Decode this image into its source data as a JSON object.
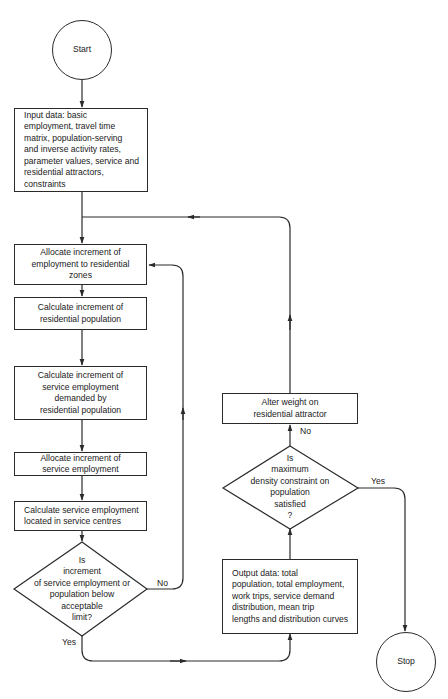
{
  "diagram": {
    "type": "flowchart",
    "nodes": {
      "start": {
        "label": "Start",
        "shape": "circle"
      },
      "input": {
        "label": "Input data: basic\nemployment, travel time\nmatrix, population-serving\nand inverse activity rates,\nparameter values, service and\nresidential attractors, constraints",
        "shape": "process"
      },
      "allocate_employment": {
        "label": "Allocate increment of\nemployment to residential\nzones",
        "shape": "process"
      },
      "calc_residential": {
        "label": "Calculate increment of\nresidential population",
        "shape": "process"
      },
      "calc_service_demand": {
        "label": "Calculate increment of\nservice employment\ndemanded by\nresidential population",
        "shape": "process"
      },
      "allocate_service": {
        "label": "Allocate increment of\nservice employment",
        "shape": "process"
      },
      "calc_service_centres": {
        "label": "Calculate service employment\nlocated in service centres",
        "shape": "process"
      },
      "decision_increment": {
        "label": "Is\nincrement\nof service employment or\npopulation below\nacceptable\nlimit?",
        "shape": "decision"
      },
      "output": {
        "label": "Output data: total\npopulation, total employment,\nwork trips, service demand\ndistribution, mean trip\nlengths and distribution curves",
        "shape": "process"
      },
      "decision_density": {
        "label": "Is\nmaximum\ndensity constraint on\npopulation\nsatisfied\n?",
        "shape": "decision"
      },
      "alter_weight": {
        "label": "Alter weight on\nresidential attractor",
        "shape": "process"
      },
      "stop": {
        "label": "Stop",
        "shape": "circle"
      }
    },
    "edge_labels": {
      "increment_no": "No",
      "increment_yes": "Yes",
      "density_no": "No",
      "density_yes": "Yes"
    },
    "edges": [
      {
        "from": "start",
        "to": "input"
      },
      {
        "from": "input",
        "to": "allocate_employment"
      },
      {
        "from": "allocate_employment",
        "to": "calc_residential"
      },
      {
        "from": "calc_residential",
        "to": "calc_service_demand"
      },
      {
        "from": "calc_service_demand",
        "to": "allocate_service"
      },
      {
        "from": "allocate_service",
        "to": "calc_service_centres"
      },
      {
        "from": "calc_service_centres",
        "to": "decision_increment"
      },
      {
        "from": "decision_increment",
        "to": "allocate_employment",
        "label": "No"
      },
      {
        "from": "decision_increment",
        "to": "output",
        "label": "Yes"
      },
      {
        "from": "output",
        "to": "decision_density"
      },
      {
        "from": "decision_density",
        "to": "alter_weight",
        "label": "No"
      },
      {
        "from": "decision_density",
        "to": "stop",
        "label": "Yes"
      },
      {
        "from": "alter_weight",
        "to": "allocate_employment"
      }
    ]
  },
  "colors": {
    "line": "#2a2a2a",
    "background": "#ffffff"
  }
}
